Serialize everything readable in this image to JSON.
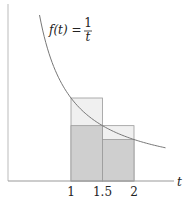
{
  "chart_data": {
    "type": "line",
    "title": "",
    "function_label": {
      "lhs": "f(t) =",
      "num": "1",
      "den": "t"
    },
    "xlabel": "t",
    "ylabel": "",
    "x_ticks": [
      {
        "value": 1,
        "label": "1"
      },
      {
        "value": 1.5,
        "label": "1.5"
      },
      {
        "value": 2,
        "label": "2"
      }
    ],
    "xlim": [
      0,
      2.6
    ],
    "ylim": [
      0,
      2.0
    ],
    "grid": false,
    "curve": {
      "expr": "1/t",
      "t_start": 0.5,
      "t_end": 2.5
    },
    "rectangles": [
      {
        "name": "upper-left",
        "x0": 1,
        "x1": 1.5,
        "height": 1.0,
        "fill": "#f0f0f0"
      },
      {
        "name": "upper-right",
        "x0": 1.5,
        "x1": 2,
        "height": 0.6667,
        "fill": "#f0f0f0"
      },
      {
        "name": "lower-left",
        "x0": 1,
        "x1": 1.5,
        "height": 0.6667,
        "fill": "#cfcfcf"
      },
      {
        "name": "lower-right",
        "x0": 1.5,
        "x1": 2,
        "height": 0.5,
        "fill": "#cfcfcf"
      }
    ],
    "colors": {
      "curve": "#777777",
      "axis": "#999999",
      "edge": "#999999"
    }
  }
}
